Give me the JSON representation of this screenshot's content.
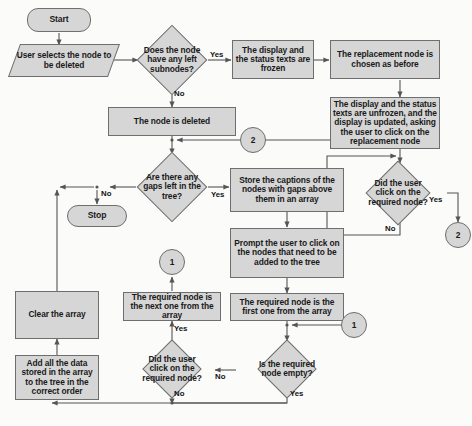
{
  "diagram": {
    "palette": {
      "shape_fill": "#d6d6d6",
      "shape_stroke": "#6e6e6e",
      "line": "#555555",
      "text": "#1a1a1a",
      "background": "#fbfbfa"
    },
    "nodes": {
      "start": "Start",
      "user_selects": "User selects the node to be deleted",
      "has_left_subnodes": "Does the node have any left subnodes?",
      "display_frozen": "The display and the status texts are frozen",
      "replacement_chosen": "The replacement node is chosen as before",
      "display_unfrozen": "The display and the status texts are unfrozen, and the display is updated, asking the user to click on the replacement node",
      "did_user_click_replacement": "Did the user click on the required node?",
      "node_deleted": "The node is deleted",
      "any_gaps": "Are there any gaps left in the tree?",
      "stop": "Stop",
      "store_captions": "Store the captions of the nodes with gaps above them in an array",
      "prompt_user": "Prompt the user to click on the nodes that need to be added to the tree",
      "required_first": "The required node is the first one from the array",
      "required_next": "The required node is the next one from the array",
      "is_required_empty": "Is the required node empty?",
      "did_user_click_required": "Did the user click on the required node?",
      "clear_array": "Clear the array",
      "add_all_data": "Add all the data stored in the array to the tree in the correct order"
    },
    "connectors": {
      "two_left": "2",
      "two_right": "2",
      "one_left": "1",
      "one_right": "1"
    },
    "edge_labels": {
      "subnodes_yes": "Yes",
      "subnodes_no": "No",
      "gaps_no": "No",
      "gaps_yes": "Yes",
      "replacement_yes": "Yes",
      "replacement_no": "No",
      "required_empty_yes": "Yes",
      "required_empty_no": "No",
      "click_required_yes": "Yes",
      "click_required_no": "No"
    }
  }
}
